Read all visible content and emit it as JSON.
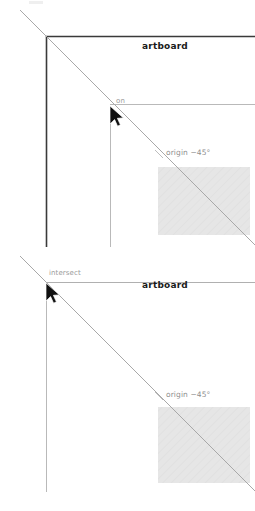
{
  "document": {
    "title": "Artboard snapping guides",
    "panel_count": 2
  },
  "colors": {
    "artboard_edge_strong": "#3a3a3a",
    "guide_line_light": "#b9b9b9",
    "origin_line": "#a8a8a8",
    "shape_fill": "#e4e4e4",
    "hint_text": "#9a9a9a",
    "artboard_text": "#1a1a1a",
    "cursor_fill": "#111111",
    "background": "#ffffff"
  },
  "panels": [
    {
      "id": "panel-top",
      "name": "on-edge-snap",
      "labels": {
        "artboard": "artboard",
        "snap_hint": "on",
        "origin": "origin −45°"
      },
      "cursor": {
        "x": 110,
        "y": 106
      },
      "artboard_corner": {
        "x": 46,
        "y": 36
      },
      "guide_y": 104,
      "shape": {
        "x": 158,
        "y": 167,
        "width": 92,
        "height": 68
      }
    },
    {
      "id": "panel-bottom",
      "name": "intersect-snap",
      "labels": {
        "artboard": "artboard",
        "snap_hint": "intersect",
        "origin": "origin −45°"
      },
      "cursor": {
        "x": 46,
        "y": 283
      },
      "artboard_corner": {
        "x": 46,
        "y": 282
      },
      "guide_y": 282,
      "shape": {
        "x": 158,
        "y": 407,
        "width": 92,
        "height": 76
      }
    }
  ],
  "annotations": {
    "angle_value": "−45°",
    "origin_keyword": "origin",
    "on_keyword": "on",
    "intersect_keyword": "intersect",
    "artboard_keyword": "artboard"
  }
}
